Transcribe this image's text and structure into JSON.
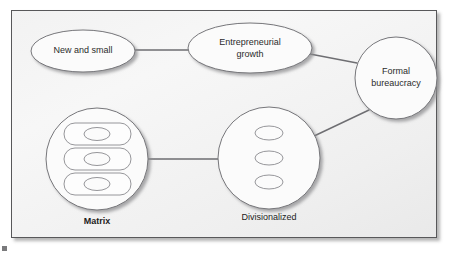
{
  "figure": {
    "type": "organizational-structure-evolution-diagram",
    "background_color": "#f6f6f6",
    "frame_border_color": "#58585a",
    "shape_stroke_color": "#76767a",
    "connector_color": "#6e6e72",
    "text_color": "#2b2b2b"
  },
  "nodes": [
    {
      "id": "new-and-small",
      "shape": "ellipse",
      "label": "New and small",
      "label_lines": [
        "New and small"
      ],
      "cx": 83,
      "cy": 51,
      "rx": 52,
      "ry": 21
    },
    {
      "id": "entrepreneurial-growth",
      "shape": "ellipse",
      "label": "Entrepreneurial growth",
      "label_lines": [
        "Entrepreneurial",
        "growth"
      ],
      "cx": 250,
      "cy": 48,
      "rx": 62,
      "ry": 25
    },
    {
      "id": "formal-bureaucracy",
      "shape": "circle",
      "label": "Formal bureaucracy",
      "label_lines": [
        "Formal",
        "bureaucracy"
      ],
      "cx": 396,
      "cy": 78,
      "rx": 41,
      "ry": 41
    },
    {
      "id": "divisionalized",
      "shape": "circle-with-three-ellipses",
      "label": "Divisionalized",
      "label_lines": [],
      "outer_label": "Divisionalized",
      "outer_label_bold": false,
      "cx": 269,
      "cy": 158,
      "rx": 51,
      "ry": 51,
      "inner_ellipses": [
        {
          "cx": 269,
          "cy": 133,
          "rx": 14,
          "ry": 7
        },
        {
          "cx": 269,
          "cy": 158,
          "rx": 14,
          "ry": 7
        },
        {
          "cx": 269,
          "cy": 182,
          "rx": 14,
          "ry": 7
        }
      ]
    },
    {
      "id": "matrix",
      "shape": "circle-with-three-stadiums",
      "label": "Matrix",
      "label_lines": [],
      "outer_label": "Matrix",
      "outer_label_bold": true,
      "cx": 97,
      "cy": 159,
      "rx": 51,
      "ry": 51,
      "inner_rows": [
        {
          "x": 64,
          "y": 123,
          "width": 67,
          "height": 22,
          "rx": 11,
          "ellipse": {
            "cx": 97,
            "cy": 134,
            "rx": 13,
            "ry": 6.5
          }
        },
        {
          "x": 64,
          "y": 148,
          "width": 67,
          "height": 22,
          "rx": 11,
          "ellipse": {
            "cx": 97,
            "cy": 159,
            "rx": 13,
            "ry": 6.5
          }
        },
        {
          "x": 64,
          "y": 173,
          "width": 67,
          "height": 22,
          "rx": 11,
          "ellipse": {
            "cx": 97,
            "cy": 184,
            "rx": 13,
            "ry": 6.5
          }
        }
      ]
    }
  ],
  "connectors": [
    {
      "id": "new-small-to-entrepreneurial",
      "from": "new-and-small",
      "to": "entrepreneurial-growth",
      "x1": 135,
      "y1": 50,
      "x2": 189,
      "y2": 50
    },
    {
      "id": "entrepreneurial-to-formal",
      "from": "entrepreneurial-growth",
      "to": "formal-bureaucracy",
      "x1": 310,
      "y1": 54,
      "x2": 357,
      "y2": 63
    },
    {
      "id": "formal-to-divisionalized",
      "from": "formal-bureaucracy",
      "to": "divisionalized",
      "x1": 369,
      "y1": 110,
      "x2": 312,
      "y2": 137
    },
    {
      "id": "divisionalized-to-matrix",
      "from": "divisionalized",
      "to": "matrix",
      "x1": 218,
      "y1": 159,
      "x2": 148,
      "y2": 159
    }
  ],
  "outer_labels": [
    {
      "id": "matrix-label",
      "text": "Matrix",
      "x": 97,
      "y": 224,
      "bold": true
    },
    {
      "id": "divisionalized-label",
      "text": "Divisionalized",
      "x": 269,
      "y": 220,
      "bold": false
    }
  ]
}
